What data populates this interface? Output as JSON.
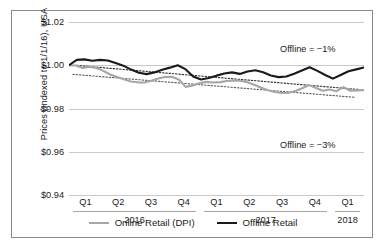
{
  "chart_data": {
    "type": "line",
    "title": "",
    "xlabel": "",
    "ylabel": "Prices (Indexed to 1/1/16), USA",
    "ylim": [
      0.94,
      1.02
    ],
    "yticks": [
      "$0.94",
      "$0.96",
      "$0.98",
      "$1.00",
      "$1.02"
    ],
    "ytick_values": [
      0.94,
      0.96,
      0.98,
      1.0,
      1.02
    ],
    "grid": true,
    "legend_position": "bottom",
    "x_quarter_labels": [
      "Q1",
      "Q2",
      "Q3",
      "Q4",
      "Q1",
      "Q2",
      "Q3",
      "Q4",
      "Q1"
    ],
    "x_year_groups": [
      {
        "label": "2016",
        "quarters": [
          "Q1",
          "Q2",
          "Q3",
          "Q4"
        ]
      },
      {
        "label": "2017",
        "quarters": [
          "Q1",
          "Q2",
          "Q3",
          "Q4"
        ]
      },
      {
        "label": "2018",
        "quarters": [
          "Q1"
        ]
      }
    ],
    "annotations": [
      {
        "text": "Offline = −1%",
        "series": "Offline Retail"
      },
      {
        "text": "Offline = −3%",
        "series": "Online Retail (DPI)"
      }
    ],
    "colors": {
      "online": "#a6a6a6",
      "offline": "#1a1a1a",
      "trend": "#595959",
      "grid": "#c9c9c9"
    },
    "series": [
      {
        "name": "Online Retail (DPI)",
        "color": "#a6a6a6",
        "style": "solid",
        "values": [
          1.0,
          0.9999,
          0.9987,
          0.9993,
          0.9987,
          0.9974,
          0.9957,
          0.9946,
          0.9935,
          0.9925,
          0.9921,
          0.992,
          0.9928,
          0.9939,
          0.9946,
          0.9947,
          0.9934,
          0.99,
          0.9906,
          0.9917,
          0.9923,
          0.992,
          0.9922,
          0.9927,
          0.993,
          0.9928,
          0.9921,
          0.991,
          0.9896,
          0.9884,
          0.9876,
          0.9872,
          0.9873,
          0.9881,
          0.9894,
          0.9908,
          0.9895,
          0.9882,
          0.9888,
          0.988,
          0.9899,
          0.9882,
          0.9884,
          0.9885
        ]
      },
      {
        "name": "Offline Retail",
        "color": "#1a1a1a",
        "style": "solid",
        "values": [
          1.0,
          1.0025,
          1.0027,
          1.0021,
          1.0025,
          1.0022,
          1.001,
          0.9998,
          0.998,
          0.9965,
          0.9959,
          0.9967,
          0.9979,
          0.9989,
          1.0,
          0.9982,
          0.9948,
          0.9934,
          0.9941,
          0.9952,
          0.9962,
          0.9967,
          0.996,
          0.9971,
          0.9977,
          0.9968,
          0.9953,
          0.9945,
          0.9948,
          0.9961,
          0.9976,
          0.9991,
          0.9974,
          0.9955,
          0.9938,
          0.9955,
          0.9972,
          0.9981,
          0.999
        ]
      }
    ],
    "trendlines": [
      {
        "name": "Offline trend",
        "style": "dotted",
        "start": 0.9999,
        "end": 0.9888,
        "change_pct": -1
      },
      {
        "name": "Online trend",
        "style": "dotted",
        "start": 0.9958,
        "end": 0.9852,
        "change_pct": -3
      }
    ]
  },
  "legend": {
    "items": [
      {
        "label": "Online Retail (DPI)",
        "swatch": "online-line-swatch"
      },
      {
        "label": "Offline Retail",
        "swatch": "offline-line-swatch"
      }
    ]
  }
}
